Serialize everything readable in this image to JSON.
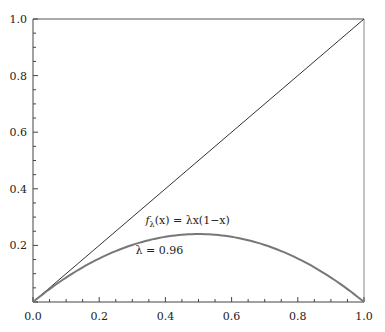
{
  "chart_data": {
    "type": "line",
    "title": "",
    "xlabel": "",
    "ylabel": "",
    "xlim": [
      0,
      1
    ],
    "ylim": [
      0,
      1
    ],
    "grid": false,
    "legend": null,
    "x_ticks": [
      "0.0",
      "0.2",
      "0.4",
      "0.6",
      "0.8",
      "1.0"
    ],
    "y_ticks": [
      "0.2",
      "0.4",
      "0.6",
      "0.8",
      "1.0"
    ],
    "series": [
      {
        "name": "y = x",
        "color": "#333333",
        "x": [
          0,
          1
        ],
        "y": [
          0,
          1
        ]
      },
      {
        "name": "f_λ(x) = λx(1−x), λ = 0.96",
        "color": "#777777",
        "lambda": 0.96,
        "x": [
          0,
          0.1,
          0.2,
          0.3,
          0.4,
          0.5,
          0.6,
          0.7,
          0.8,
          0.9,
          1.0
        ],
        "y": [
          0,
          0.0864,
          0.1536,
          0.2016,
          0.2304,
          0.24,
          0.2304,
          0.2016,
          0.1536,
          0.0864,
          0
        ]
      }
    ],
    "annotations": [
      {
        "text_fn": "f",
        "text_sub": "λ",
        "text_rest": "(x) = λx(1−x)",
        "x": 0.34,
        "y": 0.275
      },
      {
        "text": "λ = 0.96",
        "x": 0.31,
        "y": 0.17
      }
    ]
  }
}
